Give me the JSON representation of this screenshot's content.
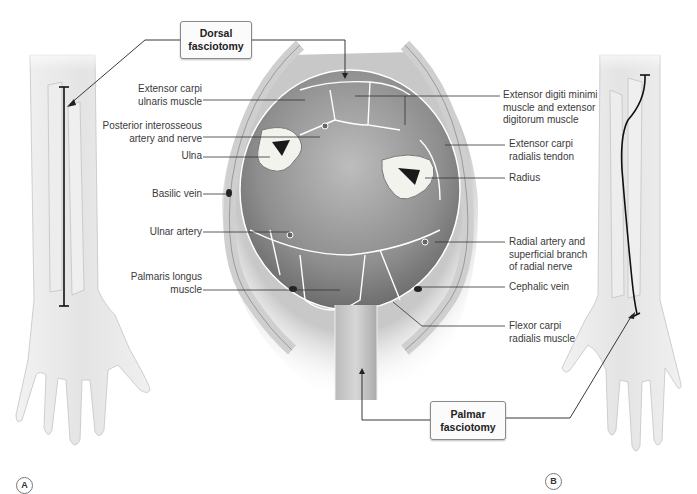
{
  "figure": {
    "panels": [
      {
        "id": "A",
        "description": "Dorsal forearm and hand with straight incision line"
      },
      {
        "id": "B",
        "description": "Palmar forearm and hand with curvilinear incision line"
      }
    ],
    "callouts": {
      "dorsal": "Dorsal\nfasciotomy",
      "palmar": "Palmar\nfasciotomy"
    },
    "labels_left": [
      {
        "key": "ecu",
        "text": "Extensor carpi\nulnaris muscle"
      },
      {
        "key": "pian",
        "text": "Posterior interosseous\nartery and nerve"
      },
      {
        "key": "ulna",
        "text": "Ulna"
      },
      {
        "key": "basilic",
        "text": "Basilic vein"
      },
      {
        "key": "ulnar_artery",
        "text": "Ulnar artery"
      },
      {
        "key": "palmaris",
        "text": "Palmaris longus\nmuscle"
      }
    ],
    "labels_right": [
      {
        "key": "edm",
        "text": "Extensor digiti minimi\nmuscle and extensor\ndigitorum muscle"
      },
      {
        "key": "ecr",
        "text": "Extensor carpi\nradialis tendon"
      },
      {
        "key": "radius",
        "text": "Radius"
      },
      {
        "key": "radial_artery",
        "text": "Radial artery and\nsuperficial branch\nof radial nerve"
      },
      {
        "key": "cephalic",
        "text": "Cephalic vein"
      },
      {
        "key": "fcr",
        "text": "Flexor carpi\nradialis muscle"
      }
    ],
    "panel_letters": {
      "a": "A",
      "b": "B"
    },
    "colors": {
      "line": "#333333",
      "skin": "#e6e6e6",
      "muscle": "#8c8c8c",
      "fascia": "#ffffff",
      "bone": "#f4f4f0"
    }
  }
}
